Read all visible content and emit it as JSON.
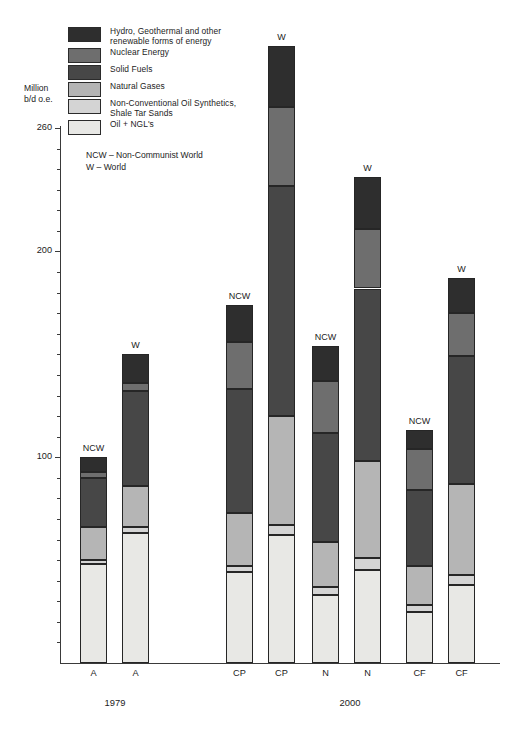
{
  "chart_data": {
    "type": "bar",
    "title": "",
    "subtype": "stacked-bar",
    "ylabel": "Million\nb/d o.e.",
    "xlabel": "",
    "ylim": [
      0,
      268
    ],
    "grid": false,
    "legend_position": "top-left",
    "y_ticks_major": [
      100,
      200,
      260
    ],
    "y_tick_labels": [
      "100",
      "200",
      "260"
    ],
    "y_minor_tick_step": 10,
    "notes": "NCW – Non-Communist World\nW – World",
    "legend": [
      {
        "name": "hydro-geothermal-renewables",
        "label": "Hydro, Geothermal and other\nrenewable forms of energy",
        "color": "#2e2e2e"
      },
      {
        "name": "nuclear-energy",
        "label": "Nuclear Energy",
        "color": "#6e6e6e"
      },
      {
        "name": "solid-fuels",
        "label": "Solid Fuels",
        "color": "#474747"
      },
      {
        "name": "natural-gases",
        "label": "Natural Gases",
        "color": "#b5b5b5"
      },
      {
        "name": "non-conventional-oil",
        "label": "Non-Conventional Oil Synthetics,\nShale Tar Sands",
        "color": "#d4d4d4"
      },
      {
        "name": "oil-ngl",
        "label": "Oil + NGL's",
        "color": "#e8e8e5"
      }
    ],
    "series": [
      {
        "name": "Oil + NGL's",
        "color": "#e8e8e5",
        "values": [
          48,
          63,
          44,
          62,
          33,
          45,
          25,
          38
        ]
      },
      {
        "name": "Non-Conventional Oil Synthetics, Shale Tar Sands",
        "color": "#d4d4d4",
        "values": [
          2,
          3,
          3,
          5,
          4,
          6,
          3,
          5
        ]
      },
      {
        "name": "Natural Gases",
        "color": "#b5b5b5",
        "values": [
          16,
          20,
          26,
          53,
          22,
          47,
          19,
          44
        ]
      },
      {
        "name": "Solid Fuels",
        "color": "#474747",
        "values": [
          24,
          46,
          60,
          112,
          53,
          84,
          37,
          62
        ]
      },
      {
        "name": "Nuclear Energy",
        "color": "#6e6e6e",
        "values": [
          3,
          4,
          23,
          38,
          25,
          29,
          20,
          21
        ]
      },
      {
        "name": "Hydro, Geothermal and other renewable forms of energy",
        "color": "#2e2e2e",
        "values": [
          7,
          14,
          18,
          30,
          17,
          25,
          9,
          17
        ]
      }
    ],
    "bars": [
      {
        "id": "bar-1979-ncw",
        "x_label": "A",
        "cap": "NCW",
        "total": 100
      },
      {
        "id": "bar-1979-w",
        "x_label": "A",
        "cap": "W",
        "total": 150
      },
      {
        "id": "bar-2000-cp-ncw",
        "x_label": "CP",
        "cap": "NCW",
        "total": 174
      },
      {
        "id": "bar-2000-cp-w",
        "x_label": "CP",
        "cap": "W",
        "total": 260
      },
      {
        "id": "bar-2000-n-ncw",
        "x_label": "N",
        "cap": "NCW",
        "total": 154
      },
      {
        "id": "bar-2000-n-w",
        "x_label": "N",
        "cap": "W",
        "total": 236
      },
      {
        "id": "bar-2000-cf-ncw",
        "x_label": "CF",
        "cap": "NCW",
        "total": 113
      },
      {
        "id": "bar-2000-cf-w",
        "x_label": "CF",
        "cap": "W",
        "total": 187
      }
    ],
    "x_groups": [
      {
        "label": "1979",
        "bars": [
          "bar-1979-ncw",
          "bar-1979-w"
        ]
      },
      {
        "label": "2000",
        "bars": [
          "bar-2000-cp-ncw",
          "bar-2000-cp-w",
          "bar-2000-n-ncw",
          "bar-2000-n-w",
          "bar-2000-cf-ncw",
          "bar-2000-cf-w"
        ]
      }
    ]
  },
  "axis": {
    "y_title": "Million\nb/d o.e.",
    "tick_260": "260",
    "tick_200": "200",
    "tick_100": "100"
  },
  "notes": {
    "text": "NCW – Non-Communist World\nW – World"
  },
  "colors": {
    "ink": "#1c1c1c",
    "axis": "#3a3a3a",
    "seg_border": "#262626"
  }
}
